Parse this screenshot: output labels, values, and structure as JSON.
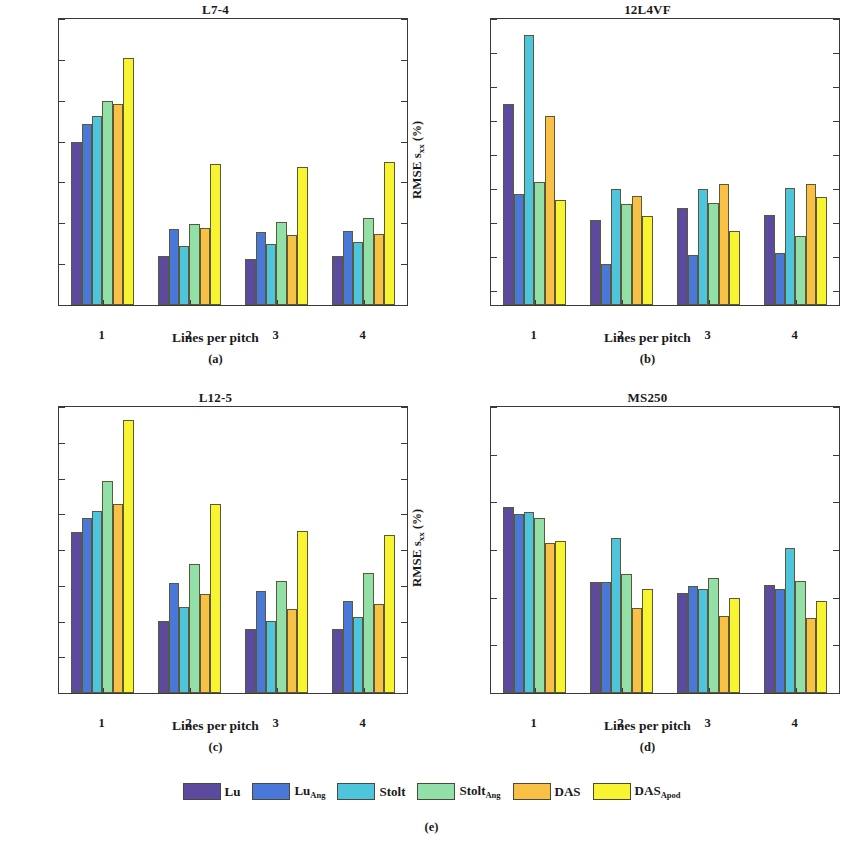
{
  "figure": {
    "subcaption_e": "(e)",
    "xlabel": "Lines per pitch",
    "ylabel_main": "RMSE s",
    "ylabel_sub": "xx",
    "ylabel_unit": "(%)"
  },
  "legend": {
    "items": [
      {
        "label": "Lu",
        "sub": "",
        "color": "#5b4a9e"
      },
      {
        "label": "Lu",
        "sub": "Ang",
        "color": "#4a78d8"
      },
      {
        "label": "Stolt",
        "sub": "",
        "color": "#4fc4dd"
      },
      {
        "label": "Stolt",
        "sub": "Ang",
        "color": "#92dfa8"
      },
      {
        "label": "DAS",
        "sub": "",
        "color": "#f8c045"
      },
      {
        "label": "DAS",
        "sub": "Apod",
        "color": "#f9f431"
      }
    ]
  },
  "chart_data": [
    {
      "type": "bar",
      "panel": "a",
      "subcaption": "(a)",
      "title": "L7-4",
      "xlabel": "Lines per pitch",
      "ylabel": "RMSE s_xx (%)",
      "categories": [
        "1",
        "2",
        "3",
        "4"
      ],
      "ylim": [
        0.4,
        1.1
      ],
      "yticks": [
        0.4,
        0.5,
        0.6,
        0.7,
        0.8,
        0.9,
        1.0,
        1.1
      ],
      "ytick_labels": [
        "0.4",
        "0.5",
        "0.6",
        "0.7",
        "0.8",
        "0.9",
        "1",
        "1.1"
      ],
      "grid": false,
      "series": [
        {
          "name": "Lu",
          "values": [
            0.8,
            0.519,
            0.512,
            0.52
          ]
        },
        {
          "name": "Lu_Ang",
          "values": [
            0.843,
            0.586,
            0.578,
            0.582
          ]
        },
        {
          "name": "Stolt",
          "values": [
            0.863,
            0.545,
            0.549,
            0.554
          ]
        },
        {
          "name": "Stolt_Ang",
          "values": [
            0.9,
            0.598,
            0.602,
            0.613
          ]
        },
        {
          "name": "DAS",
          "values": [
            0.891,
            0.588,
            0.572,
            0.575
          ]
        },
        {
          "name": "DAS_Apod",
          "values": [
            1.005,
            0.744,
            0.737,
            0.75
          ]
        }
      ]
    },
    {
      "type": "bar",
      "panel": "b",
      "subcaption": "(b)",
      "title": "12L4VF",
      "xlabel": "Lines per pitch",
      "ylabel": "RMSE s_xx (%)",
      "categories": [
        "1",
        "2",
        "3",
        "4"
      ],
      "ylim": [
        0.72,
        2.4
      ],
      "yticks": [
        0.8,
        1.0,
        1.2,
        1.4,
        1.6,
        1.8,
        2.0,
        2.2,
        2.4
      ],
      "ytick_labels": [
        "0.8",
        "1",
        "1.2",
        "1.4",
        "1.6",
        "1.8",
        "2",
        "2.2",
        "2.4"
      ],
      "grid": false,
      "series": [
        {
          "name": "Lu",
          "values": [
            1.9,
            1.222,
            1.29,
            1.25
          ]
        },
        {
          "name": "Lu_Ang",
          "values": [
            1.375,
            0.96,
            1.015,
            1.028
          ]
        },
        {
          "name": "Stolt",
          "values": [
            2.305,
            1.4,
            1.403,
            1.41
          ]
        },
        {
          "name": "Stolt_Ang",
          "values": [
            1.44,
            1.315,
            1.318,
            1.125
          ]
        },
        {
          "name": "DAS",
          "values": [
            1.83,
            1.358,
            1.428,
            1.43
          ]
        },
        {
          "name": "DAS_Apod",
          "values": [
            1.338,
            1.24,
            1.155,
            1.352
          ]
        }
      ]
    },
    {
      "type": "bar",
      "panel": "c",
      "subcaption": "(c)",
      "title": "L12-5",
      "xlabel": "Lines per pitch",
      "ylabel": "RMSE s_xx (%)",
      "categories": [
        "1",
        "2",
        "3",
        "4"
      ],
      "ylim": [
        0.4,
        1.2
      ],
      "yticks": [
        0.4,
        0.5,
        0.6,
        0.7,
        0.8,
        0.9,
        1.0,
        1.1,
        1.2
      ],
      "ytick_labels": [
        "0.4",
        "0.5",
        "0.6",
        "0.7",
        "0.8",
        "0.9",
        "1",
        "1.1",
        "1.2"
      ],
      "grid": false,
      "series": [
        {
          "name": "Lu",
          "values": [
            0.85,
            0.601,
            0.58,
            0.579
          ]
        },
        {
          "name": "Lu_Ang",
          "values": [
            0.889,
            0.709,
            0.686,
            0.658
          ]
        },
        {
          "name": "Stolt",
          "values": [
            0.91,
            0.641,
            0.602,
            0.613
          ]
        },
        {
          "name": "Stolt_Ang",
          "values": [
            0.992,
            0.762,
            0.714,
            0.737
          ]
        },
        {
          "name": "DAS",
          "values": [
            0.929,
            0.677,
            0.634,
            0.648
          ]
        },
        {
          "name": "DAS_Apod",
          "values": [
            1.163,
            0.928,
            0.853,
            0.841
          ]
        }
      ]
    },
    {
      "type": "bar",
      "panel": "d",
      "subcaption": "(d)",
      "title": "MS250",
      "xlabel": "Lines per pitch",
      "ylabel": "RMSE s_xx (%)",
      "categories": [
        "1",
        "2",
        "3",
        "4"
      ],
      "ylim": [
        0.3,
        0.6
      ],
      "yticks": [
        0.3,
        0.35,
        0.4,
        0.45,
        0.5,
        0.55,
        0.6
      ],
      "ytick_labels": [
        "0.3",
        "0.35",
        "0.4",
        "0.45",
        "0.5",
        "0.55",
        "0.6"
      ],
      "grid": false,
      "series": [
        {
          "name": "Lu",
          "values": [
            0.495,
            0.416,
            0.405,
            0.413
          ]
        },
        {
          "name": "Lu_Ang",
          "values": [
            0.488,
            0.416,
            0.412,
            0.409
          ]
        },
        {
          "name": "Stolt",
          "values": [
            0.49,
            0.463,
            0.409,
            0.452
          ]
        },
        {
          "name": "Stolt_Ang",
          "values": [
            0.484,
            0.425,
            0.421,
            0.418
          ]
        },
        {
          "name": "DAS",
          "values": [
            0.457,
            0.389,
            0.381,
            0.379
          ]
        },
        {
          "name": "DAS_Apod",
          "values": [
            0.459,
            0.409,
            0.4,
            0.396
          ]
        }
      ]
    }
  ]
}
